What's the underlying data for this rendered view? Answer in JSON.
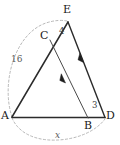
{
  "figure": {
    "type": "geometry-diagram",
    "background_color": "#ffffff",
    "stroke_color": "#2b2b2b",
    "dashed_color": "#9a9a9a",
    "vertices": [
      {
        "name": "A",
        "label": "A",
        "x": 12,
        "y": 117
      },
      {
        "name": "B",
        "label": "B",
        "x": 88,
        "y": 118
      },
      {
        "name": "C",
        "label": "C",
        "x": 50,
        "y": 40
      },
      {
        "name": "D",
        "label": "D",
        "x": 105,
        "y": 117
      },
      {
        "name": "E",
        "label": "E",
        "x": 68,
        "y": 22
      }
    ],
    "segments": [
      {
        "name": "segment-AE",
        "from": "A",
        "to": "E",
        "style": "solid"
      },
      {
        "name": "segment-AD",
        "from": "A",
        "to": "D",
        "style": "solid"
      },
      {
        "name": "segment-ED",
        "from": "E",
        "to": "D",
        "style": "solid",
        "marker": "single-arrow"
      },
      {
        "name": "segment-CB",
        "from": "C",
        "to": "B",
        "style": "solid",
        "marker": "single-arrow"
      }
    ],
    "arcs": [
      {
        "name": "arc-AE",
        "from": "A",
        "to": "E",
        "style": "dashed",
        "label": "16"
      },
      {
        "name": "arc-AD",
        "from": "A",
        "to": "D",
        "style": "dashed",
        "label": "x",
        "italic": true
      }
    ],
    "measurements": [
      {
        "name": "length-CE",
        "label": "4",
        "segment": "CE",
        "x": 62,
        "y": 31
      },
      {
        "name": "length-BD",
        "label": "3",
        "segment": "BD",
        "x": 91,
        "y": 104
      },
      {
        "name": "length-AE",
        "label": "16",
        "segment": "AE",
        "x": 14,
        "y": 55
      },
      {
        "name": "length-AD",
        "label": "x",
        "segment": "AD",
        "x": 56,
        "y": 131,
        "italic": true
      }
    ],
    "parallel_marks": [
      {
        "name": "arrow-on-CB",
        "x": 63,
        "y": 83
      },
      {
        "name": "arrow-on-ED",
        "x": 82,
        "y": 63
      }
    ]
  }
}
